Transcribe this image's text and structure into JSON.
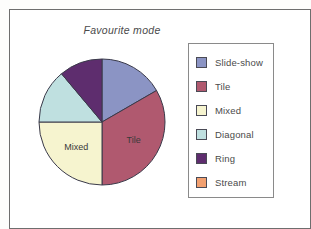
{
  "figure": {
    "title": "Favourite mode",
    "frame_color": "#6e6e6e",
    "background": "#ffffff"
  },
  "legend": {
    "name": "legend-box",
    "border_color": "#8a8a8a",
    "items": [
      {
        "label": "Slide-show",
        "color": "#8b94c4"
      },
      {
        "label": "Tile",
        "color": "#b0596f"
      },
      {
        "label": "Mixed",
        "color": "#f6f4cf"
      },
      {
        "label": "Diagonal",
        "color": "#bfe0e0"
      },
      {
        "label": "Ring",
        "color": "#5e2d6e"
      },
      {
        "label": "Stream",
        "color": "#f2a070"
      }
    ]
  },
  "chart_data": {
    "type": "pie",
    "title": "Favourite mode",
    "xlabel": "",
    "ylabel": "",
    "legend_position": "right",
    "grid": false,
    "start_angle_deg": 0,
    "direction": "clockwise",
    "categories": [
      "Slide-show",
      "Tile",
      "Mixed",
      "Diagonal",
      "Ring",
      "Stream"
    ],
    "values": [
      60,
      120,
      90,
      50,
      40,
      0
    ],
    "value_unit": "degrees",
    "colors": [
      "#8b94c4",
      "#b0596f",
      "#f6f4cf",
      "#bfe0e0",
      "#5e2d6e",
      "#f2a070"
    ],
    "slice_labels": [
      {
        "category": "Tile",
        "text": "Tile",
        "x": 94,
        "y": 76
      },
      {
        "category": "Mixed",
        "text": "Mixed",
        "x": 44,
        "y": 90
      }
    ],
    "slices": [
      {
        "label": "Slide-show",
        "start_deg": 0,
        "end_deg": 60,
        "color": "#8b94c4",
        "inner_label": ""
      },
      {
        "label": "Tile",
        "start_deg": 60,
        "end_deg": 180,
        "color": "#b0596f",
        "inner_label": "Tile"
      },
      {
        "label": "Mixed",
        "start_deg": 180,
        "end_deg": 270,
        "color": "#f6f4cf",
        "inner_label": "Mixed"
      },
      {
        "label": "Diagonal",
        "start_deg": 270,
        "end_deg": 320,
        "color": "#bfe0e0",
        "inner_label": ""
      },
      {
        "label": "Ring",
        "start_deg": 320,
        "end_deg": 360,
        "color": "#5e2d6e",
        "inner_label": ""
      },
      {
        "label": "Stream",
        "start_deg": 360,
        "end_deg": 360,
        "color": "#f2a070",
        "inner_label": ""
      }
    ]
  }
}
